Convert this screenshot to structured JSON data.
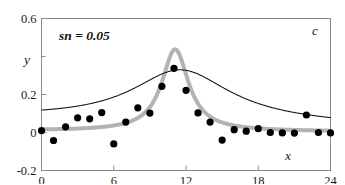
{
  "chart_data": {
    "type": "scatter",
    "title": "",
    "subtitle": "",
    "xlabel": "x",
    "ylabel": "y",
    "xlim": [
      0,
      24
    ],
    "ylim": [
      -0.2,
      0.6
    ],
    "xticks": [
      0,
      6,
      12,
      18,
      24
    ],
    "xticklabels": [
      "0",
      "6",
      "12",
      "18",
      "24"
    ],
    "yticks": [
      -0.2,
      0,
      0.2,
      0.6
    ],
    "yticklabels": [
      "-0.2",
      "0",
      "0.2",
      "0.6"
    ],
    "yminorticks": [
      0.4
    ],
    "grid": false,
    "legend": null,
    "annotations": [
      {
        "name": "noise-label",
        "text": "sn  = 0.05",
        "x": 2.0,
        "y": 0.52
      },
      {
        "name": "panel-label",
        "text": "c",
        "x": 23.0,
        "y": 0.54
      }
    ],
    "series": [
      {
        "name": "data-points",
        "type": "scatter",
        "marker": "filled-circle",
        "color": "#000000",
        "points": [
          [
            0.0,
            0.01
          ],
          [
            1.0,
            -0.042
          ],
          [
            2.0,
            0.03
          ],
          [
            3.0,
            0.077
          ],
          [
            4.0,
            0.072
          ],
          [
            5.0,
            0.105
          ],
          [
            6.0,
            -0.06
          ],
          [
            7.0,
            0.055
          ],
          [
            8.0,
            0.13
          ],
          [
            9.0,
            0.102
          ],
          [
            10.0,
            0.243
          ],
          [
            11.0,
            0.338
          ],
          [
            12.0,
            0.222
          ],
          [
            13.0,
            0.103
          ],
          [
            14.0,
            0.055
          ],
          [
            15.0,
            -0.04
          ],
          [
            16.0,
            0.015
          ],
          [
            17.0,
            0.007
          ],
          [
            18.0,
            0.02
          ],
          [
            19.0,
            0.0
          ],
          [
            20.0,
            -0.002
          ],
          [
            21.0,
            -0.003
          ],
          [
            22.0,
            0.092
          ],
          [
            23.0,
            0.0
          ],
          [
            24.0,
            -0.002
          ]
        ]
      },
      {
        "name": "broad-fit-curve",
        "type": "line",
        "color": "#1a1a1a",
        "linewidth": 1.1,
        "peak_x": 11.5,
        "peak_y": 0.33,
        "baseline_left": 0.078,
        "baseline_right": 0.038,
        "halfwidth": 5.0
      },
      {
        "name": "sharp-fit-curve",
        "type": "line",
        "color": "#b3b3b3",
        "linewidth": 4.0,
        "peak_x": 11.1,
        "peak_y": 0.438,
        "baseline_left": 0.01,
        "baseline_right": 0.005,
        "halfwidth": 1.35
      }
    ]
  },
  "colors": {
    "frame": "#8a8a8a",
    "marker": "#000000",
    "broad_curve": "#1a1a1a",
    "sharp_curve": "#b3b3b3",
    "text": "#1a1a1a",
    "background": "#ffffff"
  }
}
